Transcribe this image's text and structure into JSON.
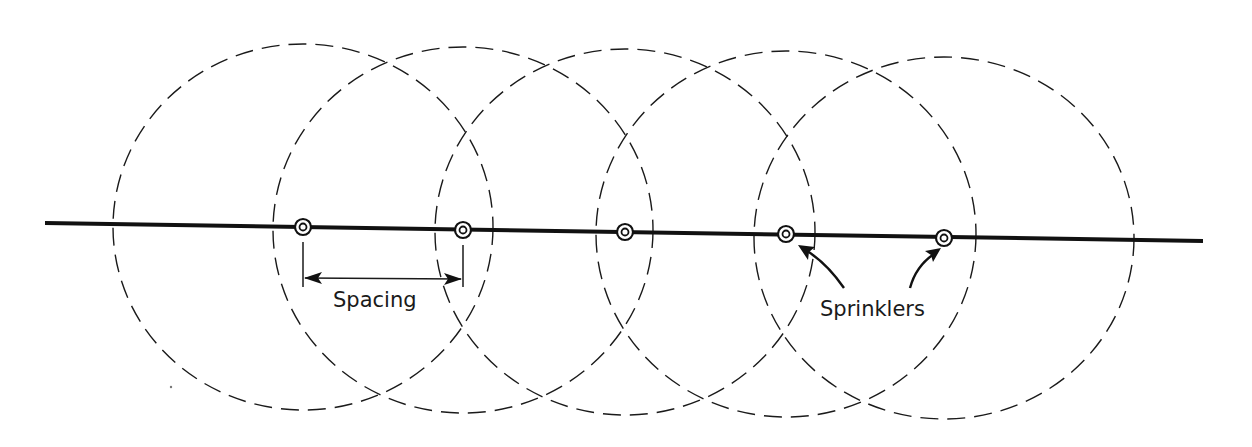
{
  "diagram": {
    "pipe": {
      "x1": 45,
      "y1": 223,
      "x2": 1203,
      "y2": 241
    },
    "sprinklers": [
      {
        "cx": 303,
        "cy": 227
      },
      {
        "cx": 463,
        "cy": 230
      },
      {
        "cx": 625,
        "cy": 232
      },
      {
        "cx": 786,
        "cy": 234
      },
      {
        "cx": 944,
        "cy": 238
      }
    ],
    "coverage_radius_x": 190,
    "coverage_radius_y": 183,
    "labels": {
      "spacing": "Spacing",
      "sprinklers": "Sprinklers"
    },
    "spacing_dimension": {
      "from_sprinkler": 1,
      "to_sprinkler": 2
    },
    "sprinkler_label_points_to": [
      4,
      5
    ]
  }
}
